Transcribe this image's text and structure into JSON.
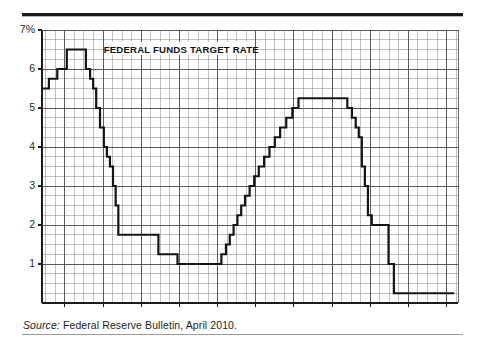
{
  "figure": {
    "title": "FEDERAL FUNDS TARGET RATE",
    "source_label": "Source:",
    "source_text": "Federal Reserve Bulletin, April 2010.",
    "rule_color": "#1a1a1a"
  },
  "chart_data": {
    "type": "line",
    "title": "FEDERAL FUNDS TARGET RATE",
    "xlabel": "",
    "ylabel": "7%",
    "y_unit_label": "7%",
    "xlim": [
      1999.4,
      2010.3
    ],
    "ylim": [
      0,
      7
    ],
    "yticks": [
      1,
      2,
      3,
      4,
      5,
      6,
      7
    ],
    "ytick_labels": [
      "1",
      "2",
      "3",
      "4",
      "5",
      "6",
      "7%"
    ],
    "xticks": [
      2000,
      2001,
      2002,
      2003,
      2004,
      2005,
      2006,
      2007,
      2008,
      2009,
      2010
    ],
    "xtick_labels": [
      "2000",
      "2001",
      "2002",
      "2003",
      "2004",
      "2005",
      "2006",
      "2007",
      "2008",
      "2009",
      "2010"
    ],
    "grid": true,
    "grid_minor_x_per_year": 4,
    "grid_minor_y_step": 0.25,
    "legend": "none",
    "line_color": "#141414",
    "line_width": 2.2,
    "step_style": "post",
    "series": [
      {
        "name": "Federal funds target rate",
        "values": [
          [
            1999.4,
            5.5
          ],
          [
            1999.58,
            5.75
          ],
          [
            1999.8,
            6.0
          ],
          [
            2000.05,
            6.5
          ],
          [
            2000.55,
            6.0
          ],
          [
            2000.66,
            5.75
          ],
          [
            2000.74,
            5.5
          ],
          [
            2000.82,
            5.0
          ],
          [
            2000.92,
            4.5
          ],
          [
            2001.02,
            4.0
          ],
          [
            2001.1,
            3.75
          ],
          [
            2001.18,
            3.5
          ],
          [
            2001.26,
            3.0
          ],
          [
            2001.33,
            2.5
          ],
          [
            2001.4,
            1.75
          ],
          [
            2002.45,
            1.25
          ],
          [
            2002.95,
            1.0
          ],
          [
            2004.1,
            1.25
          ],
          [
            2004.22,
            1.5
          ],
          [
            2004.32,
            1.75
          ],
          [
            2004.42,
            2.0
          ],
          [
            2004.52,
            2.25
          ],
          [
            2004.62,
            2.5
          ],
          [
            2004.72,
            2.75
          ],
          [
            2004.84,
            3.0
          ],
          [
            2004.96,
            3.25
          ],
          [
            2005.08,
            3.5
          ],
          [
            2005.22,
            3.75
          ],
          [
            2005.36,
            4.0
          ],
          [
            2005.5,
            4.25
          ],
          [
            2005.64,
            4.5
          ],
          [
            2005.8,
            4.75
          ],
          [
            2005.96,
            5.0
          ],
          [
            2006.12,
            5.25
          ],
          [
            2007.4,
            5.0
          ],
          [
            2007.52,
            4.75
          ],
          [
            2007.62,
            4.5
          ],
          [
            2007.7,
            4.25
          ],
          [
            2007.78,
            3.5
          ],
          [
            2007.86,
            3.0
          ],
          [
            2007.94,
            2.25
          ],
          [
            2008.04,
            2.0
          ],
          [
            2008.48,
            1.0
          ],
          [
            2008.62,
            0.25
          ],
          [
            2010.2,
            0.25
          ]
        ]
      }
    ],
    "annotations": [
      {
        "text": "FEDERAL FUNDS TARGET RATE",
        "x": 2003.05,
        "y": 6.5,
        "bold": true
      }
    ]
  }
}
